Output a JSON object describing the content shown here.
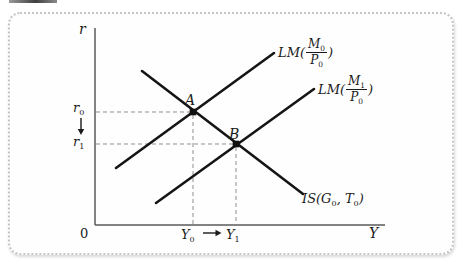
{
  "colors": {
    "curve": "#151515",
    "axis": "#5a5a5a",
    "dashed_guide": "#8f8f8f",
    "panel_border": "#c6c6c6"
  },
  "diagram": {
    "axis": {
      "y": "r",
      "x": "Y",
      "origin": "0"
    },
    "ticks": {
      "r0": {
        "base": "r",
        "sub": "0"
      },
      "r1": {
        "base": "r",
        "sub": "1"
      },
      "y0": {
        "base": "Y",
        "sub": "0"
      },
      "y1": {
        "base": "Y",
        "sub": "1"
      }
    },
    "points": {
      "a": "A",
      "b": "B"
    },
    "curves": {
      "lm0": {
        "prefix": "LM(",
        "num_base": "M",
        "num_sub": "0",
        "den_base": "P",
        "den_sub": "0",
        "suffix": ")"
      },
      "lm1": {
        "prefix": "LM(",
        "num_base": "M",
        "num_sub": "1",
        "den_base": "P",
        "den_sub": "0",
        "suffix": ")"
      },
      "is": {
        "p1": "IS(G",
        "s1": "0",
        "p2": ", T",
        "s2": "0",
        "p3": ")"
      }
    }
  },
  "figure": {
    "type": "line",
    "curves": [
      {
        "id": "LM0",
        "label": "LM(M0/P0)",
        "slope": "positive"
      },
      {
        "id": "LM1",
        "label": "LM(M1/P0)",
        "slope": "positive"
      },
      {
        "id": "IS",
        "label": "IS(G0, T0)",
        "slope": "negative"
      }
    ],
    "equilibria": [
      {
        "point": "A",
        "rate": "r0",
        "output": "Y0",
        "intersection_of": [
          "IS",
          "LM0"
        ]
      },
      {
        "point": "B",
        "rate": "r1",
        "output": "Y1",
        "intersection_of": [
          "IS",
          "LM1"
        ]
      }
    ],
    "arrows": [
      {
        "axis": "r",
        "from": "r0",
        "to": "r1",
        "direction": "down"
      },
      {
        "axis": "Y",
        "from": "Y0",
        "to": "Y1",
        "direction": "right"
      }
    ],
    "legend_position": "labels-at-curve-ends",
    "grid": false
  }
}
